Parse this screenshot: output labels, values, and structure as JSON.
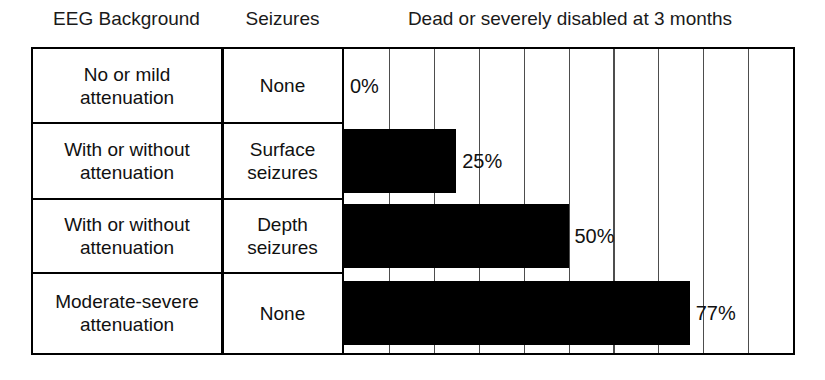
{
  "headers": {
    "eeg": "EEG Background",
    "seizures": "Seizures",
    "outcome": "Dead or severely disabled at 3 months"
  },
  "rows": [
    {
      "eeg": "No or mild attenuation",
      "seizures": "None",
      "label": "0%",
      "value": 0
    },
    {
      "eeg": "With or without attenuation",
      "seizures": "Surface seizures",
      "label": "25%",
      "value": 25
    },
    {
      "eeg": "With or without attenuation",
      "seizures": "Depth seizures",
      "label": "50%",
      "value": 50
    },
    {
      "eeg": "Moderate-severe attenuation",
      "seizures": "None",
      "label": "77%",
      "value": 77
    }
  ],
  "chart_data": {
    "type": "bar",
    "orientation": "horizontal",
    "title": "Dead or severely disabled at 3 months",
    "xlabel": "",
    "ylabel": "",
    "xlim": [
      0,
      100
    ],
    "grid": true,
    "gridline_step": 10,
    "gridlines": [
      10,
      20,
      30,
      40,
      50,
      60,
      70,
      80,
      90
    ],
    "legend": "none",
    "bar_color": "#000000",
    "categories": [
      "No or mild attenuation / None",
      "With or without attenuation / Surface seizures",
      "With or without attenuation / Depth seizures",
      "Moderate-severe attenuation / None"
    ],
    "values": [
      0,
      25,
      50,
      77
    ],
    "data_labels": [
      "0%",
      "25%",
      "50%",
      "77%"
    ]
  },
  "style": {
    "border_color": "#000000",
    "grid_color": "#4d4d4d",
    "background": "#ffffff"
  }
}
